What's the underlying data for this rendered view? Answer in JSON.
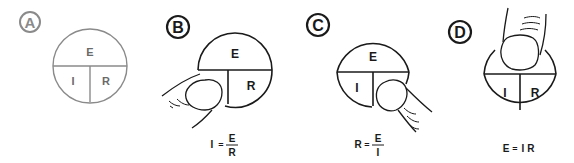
{
  "panels": [
    {
      "id": "A",
      "label": "A",
      "color": "#7a7a7a",
      "segments": {
        "top": "E",
        "bottom_left": "I",
        "bottom_right": "R"
      },
      "covered": null,
      "formula": null
    },
    {
      "id": "B",
      "label": "B",
      "color": "#1a1a1a",
      "segments": {
        "top": "E",
        "bottom_left": "I",
        "bottom_right": "R"
      },
      "covered": "I",
      "formula": {
        "lhs": "I",
        "op": "=",
        "numerator": "E",
        "denominator": "R"
      }
    },
    {
      "id": "C",
      "label": "C",
      "color": "#1a1a1a",
      "segments": {
        "top": "E",
        "bottom_left": "I",
        "bottom_right": "R"
      },
      "covered": "R",
      "formula": {
        "lhs": "R",
        "op": "=",
        "numerator": "E",
        "denominator": "I"
      }
    },
    {
      "id": "D",
      "label": "D",
      "color": "#1a1a1a",
      "segments": {
        "top": "E",
        "bottom_left": "I",
        "bottom_right": "R"
      },
      "covered": "E",
      "formula": {
        "lhs": "E",
        "op": "=",
        "rhs": "I R"
      }
    }
  ]
}
